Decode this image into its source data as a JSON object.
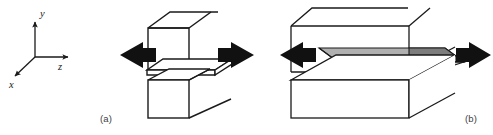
{
  "figure": {
    "background_color": "#ffffff",
    "line_color": "#1a1a1a",
    "arrow_color": "#111111",
    "shade_color": "#b0b0b0",
    "shade_dark_color": "#7d7d7d",
    "panels": [
      {
        "id": "panel-a",
        "caption": "(a)",
        "description": "cracked block with thin ligament, tensile arrows",
        "arrows": [
          "left-arrow",
          "right-arrow"
        ]
      },
      {
        "id": "panel-b",
        "caption": "(b)",
        "description": "wide block with shaded plastic zone, tensile arrows",
        "arrows": [
          "left-arrow",
          "right-arrow"
        ]
      }
    ]
  },
  "axes": {
    "name": "coordinate-triad",
    "origin": {
      "x": 35,
      "y": 57
    },
    "labels": {
      "y": "y",
      "z": "z",
      "x": "x"
    }
  }
}
